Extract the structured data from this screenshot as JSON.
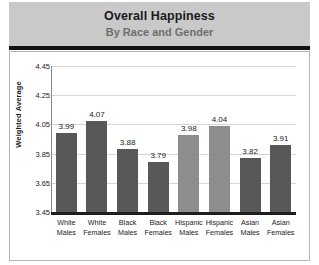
{
  "header": {
    "title": "Overall Happiness",
    "subtitle": "By Race and Gender"
  },
  "chart_data": {
    "type": "bar",
    "title": "Overall Happiness",
    "subtitle": "By Race and Gender",
    "xlabel": "",
    "ylabel": "Weighted Average",
    "ylim": [
      3.45,
      4.45
    ],
    "ytick_step": 0.2,
    "yticks": [
      "4.45",
      "4.25",
      "4.05",
      "3.85",
      "3.65",
      "3.45"
    ],
    "ytick_values": [
      4.45,
      4.25,
      4.05,
      3.85,
      3.65,
      3.45
    ],
    "grid": true,
    "legend": false,
    "categories": [
      "White Males",
      "White Females",
      "Black Males",
      "Black Females",
      "Hispanic Males",
      "Hispanic Females",
      "Asian Males",
      "Asian Females"
    ],
    "category_lines": [
      [
        "White",
        "Males"
      ],
      [
        "White",
        "Females"
      ],
      [
        "Black",
        "Males"
      ],
      [
        "Black",
        "Females"
      ],
      [
        "Hispanic",
        "Males"
      ],
      [
        "Hispanic",
        "Females"
      ],
      [
        "Asian",
        "Males"
      ],
      [
        "Asian",
        "Females"
      ]
    ],
    "values": [
      3.99,
      4.07,
      3.88,
      3.79,
      3.98,
      4.04,
      3.82,
      3.91
    ],
    "value_labels": [
      "3.99",
      "4.07",
      "3.88",
      "3.79",
      "3.98",
      "4.04",
      "3.82",
      "3.91"
    ],
    "bar_colors": [
      "#58585a",
      "#58585a",
      "#58585a",
      "#58585a",
      "#8d8d8f",
      "#8d8d8f",
      "#58585a",
      "#58585a"
    ]
  },
  "colors": {
    "header_band": "#c9c9c9",
    "header_rule": "#111111",
    "bar_dark": "#58585a",
    "bar_light": "#8d8d8f",
    "gridline": "#d6d6d6",
    "axis": "#1e1e1e",
    "panel_border": "#b5b5b5",
    "title_text": "#1a1a1a",
    "subtitle_text": "#6e6e6e"
  }
}
